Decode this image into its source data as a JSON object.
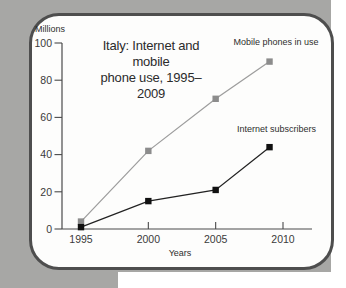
{
  "background": {
    "sheet_color": "#a7a7a5",
    "page_color": "#ffffff",
    "card_bg": "#fdfdfc",
    "card_border_color": "#4e4e4e"
  },
  "chart_data": {
    "type": "line",
    "title": "Italy: Internet and mobile phone use, 1995–2009",
    "title_lines": [
      "Italy: Internet and mobile",
      "phone use, 1995–2009"
    ],
    "y_axis_label": "Millions",
    "x_axis_label": "Years",
    "ylim": [
      0,
      100
    ],
    "y_ticks": [
      0,
      20,
      40,
      60,
      80,
      100
    ],
    "xlim": [
      1995,
      2010
    ],
    "x_ticks": [
      1995,
      2000,
      2005,
      2010
    ],
    "x": [
      1995,
      2000,
      2005,
      2009
    ],
    "series": [
      {
        "name": "Mobile phones in use",
        "values": [
          4,
          42,
          70,
          90
        ],
        "line_color": "#9d9d9d",
        "marker_color": "#8c8c8c"
      },
      {
        "name": "Internet subscribers",
        "values": [
          1,
          15,
          21,
          44
        ],
        "line_color": "#222222",
        "marker_color": "#111111"
      }
    ],
    "grid": false,
    "legend_position": "inline-labels",
    "axis_color": "#4a4a4a"
  }
}
